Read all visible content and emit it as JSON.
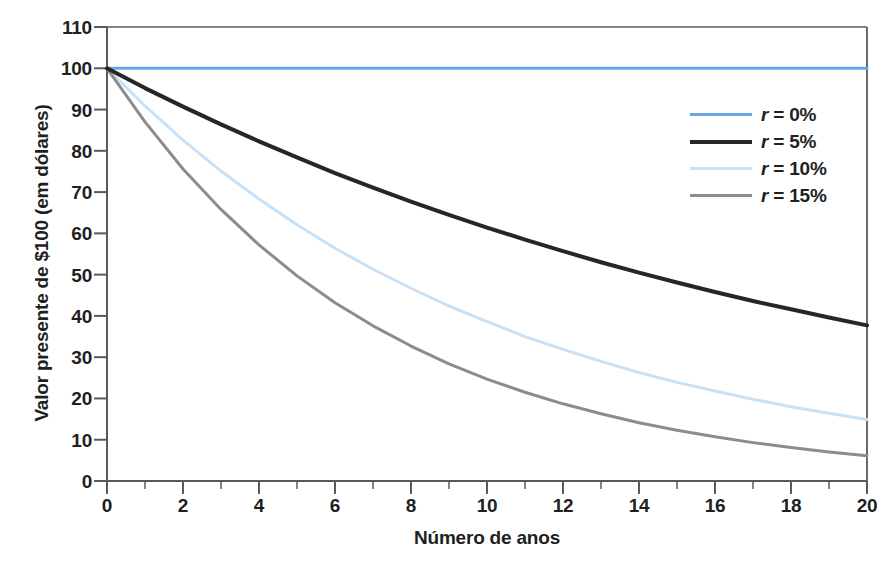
{
  "chart_data": {
    "type": "line",
    "title": "",
    "xlabel": "Número de anos",
    "ylabel": "Valor presente de $100 (em dólares)",
    "xlim": [
      0,
      20
    ],
    "ylim": [
      0,
      110
    ],
    "x_major_ticks": [
      0,
      2,
      4,
      6,
      8,
      10,
      12,
      14,
      16,
      18,
      20
    ],
    "x_minor_tick_step": 1,
    "y_major_ticks": [
      0,
      10,
      20,
      30,
      40,
      50,
      60,
      70,
      80,
      90,
      100,
      110
    ],
    "grid": false,
    "legend_position": "upper-right-inside",
    "x": [
      0,
      1,
      2,
      3,
      4,
      5,
      6,
      7,
      8,
      9,
      10,
      11,
      12,
      13,
      14,
      15,
      16,
      17,
      18,
      19,
      20
    ],
    "series": [
      {
        "name": "r = 0%",
        "rate_percent": 0,
        "color": "#66a9e2",
        "width": 3,
        "values": [
          100,
          100,
          100,
          100,
          100,
          100,
          100,
          100,
          100,
          100,
          100,
          100,
          100,
          100,
          100,
          100,
          100,
          100,
          100,
          100,
          100
        ]
      },
      {
        "name": "r = 5%",
        "rate_percent": 5,
        "color": "#262626",
        "width": 4,
        "values": [
          100,
          95.2,
          90.7,
          86.4,
          82.3,
          78.4,
          74.6,
          71.1,
          67.7,
          64.5,
          61.4,
          58.5,
          55.7,
          53.0,
          50.5,
          48.1,
          45.8,
          43.6,
          41.6,
          39.6,
          37.7
        ]
      },
      {
        "name": "r = 10%",
        "rate_percent": 10,
        "color": "#c9e1f7",
        "width": 3,
        "values": [
          100,
          90.9,
          82.6,
          75.1,
          68.3,
          62.1,
          56.4,
          51.3,
          46.7,
          42.4,
          38.6,
          35.0,
          31.9,
          29.0,
          26.3,
          23.9,
          21.8,
          19.8,
          18.0,
          16.4,
          14.9
        ]
      },
      {
        "name": "r = 15%",
        "rate_percent": 15,
        "color": "#8c8c8c",
        "width": 3,
        "values": [
          100,
          87.0,
          75.6,
          65.8,
          57.2,
          49.7,
          43.2,
          37.6,
          32.7,
          28.4,
          24.7,
          21.5,
          18.7,
          16.3,
          14.1,
          12.3,
          10.7,
          9.3,
          8.1,
          7.0,
          6.1
        ]
      }
    ],
    "legend": [
      {
        "label_prefix": "r",
        "label_suffix": " = 0%",
        "color": "#66a9e2",
        "width": 3
      },
      {
        "label_prefix": "r",
        "label_suffix": " = 5%",
        "color": "#262626",
        "width": 4
      },
      {
        "label_prefix": "r",
        "label_suffix": " = 10%",
        "color": "#c9e1f7",
        "width": 3
      },
      {
        "label_prefix": "r",
        "label_suffix": " = 15%",
        "color": "#8c8c8c",
        "width": 3
      }
    ],
    "axis_color": "#5a5a5a",
    "frame_top_color": "#5a5a5a",
    "background": "#ffffff"
  }
}
